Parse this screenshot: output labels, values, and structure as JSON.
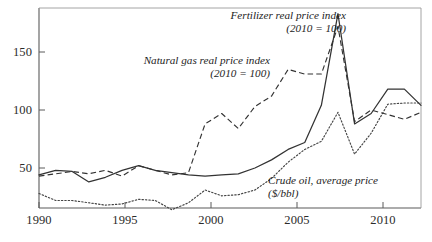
{
  "chart_data": {
    "type": "line",
    "title": "",
    "subtitle": "",
    "xlabel": "",
    "ylabel": "",
    "xlim": [
      1990,
      2013
    ],
    "ylim": [
      0,
      200
    ],
    "grid": false,
    "legend_position": "inline-annotations",
    "x_ticks": [
      1990,
      1995,
      2000,
      2005,
      2010
    ],
    "x_tick_labels": [
      "1990",
      "1995",
      "2000",
      "2005",
      "2010"
    ],
    "y_ticks": [
      50,
      100,
      150
    ],
    "y_tick_labels": [
      "50",
      "100",
      "150"
    ],
    "x": [
      1990,
      1991,
      1992,
      1993,
      1994,
      1995,
      1996,
      1997,
      1998,
      1999,
      2000,
      2001,
      2002,
      2003,
      2004,
      2005,
      2006,
      2007,
      2008,
      2009,
      2010,
      2011,
      2012,
      2013
    ],
    "series": [
      {
        "name": "Fertilizer real price index (2010 = 100)",
        "style": "solid",
        "color": "#333333",
        "values": [
          44,
          48,
          47,
          38,
          42,
          48,
          52,
          48,
          46,
          44,
          43,
          44,
          45,
          50,
          57,
          66,
          72,
          104,
          183,
          88,
          97,
          118,
          118,
          104
        ]
      },
      {
        "name": "Natural gas real price index (2010 = 100)",
        "style": "dashed",
        "color": "#333333",
        "values": [
          43,
          45,
          47,
          45,
          48,
          43,
          52,
          48,
          44,
          46,
          88,
          97,
          84,
          103,
          112,
          135,
          131,
          131,
          172,
          90,
          100,
          96,
          92,
          98
        ]
      },
      {
        "name": "Crude oil, average price ($/bbl)",
        "style": "dotted",
        "color": "#444444",
        "values": [
          28,
          22,
          22,
          20,
          18,
          19,
          23,
          22,
          14,
          20,
          31,
          26,
          27,
          31,
          41,
          55,
          66,
          73,
          98,
          62,
          80,
          105,
          106,
          106
        ]
      }
    ],
    "annotations": [
      {
        "id": "fertilizer-label",
        "line1": "Fertilizer real price index",
        "line2": "(2010 = 100)"
      },
      {
        "id": "natural-gas-label",
        "line1": "Natural gas real price index",
        "line2": "(2010 = 100)"
      },
      {
        "id": "crude-oil-label",
        "line1": "Crude oil, average price",
        "line2": "($/bbl)"
      }
    ]
  },
  "axes": {
    "y_labels": [
      "150",
      "100",
      "50"
    ],
    "x_labels": [
      "1990",
      "1995",
      "2000",
      "2005",
      "2010"
    ]
  },
  "annotations": {
    "fertilizer": {
      "line1": "Fertilizer real price index",
      "line2": "(2010 = 100)"
    },
    "natural_gas": {
      "line1": "Natural gas real price index",
      "line2": "(2010 = 100)"
    },
    "crude_oil": {
      "line1": "Crude oil, average price",
      "line2": "($/bbl)"
    }
  },
  "colors": {
    "axis": "#5a5a5a",
    "line": "#333333",
    "text": "#222222",
    "background": "#ffffff"
  }
}
